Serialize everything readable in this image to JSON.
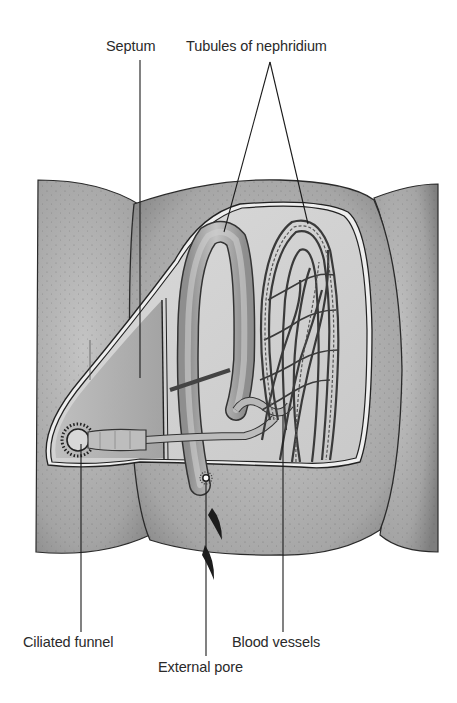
{
  "diagram": {
    "labels": {
      "septum": "Septum",
      "tubules": "Tubules of nephridium",
      "ciliated_funnel": "Ciliated funnel",
      "external_pore": "External pore",
      "blood_vessels": "Blood vessels"
    },
    "colors": {
      "body_dark": "#8c8c8c",
      "body_mid": "#a8a8a8",
      "body_light": "#c6c6c6",
      "window_bg": "#d4d4d4",
      "tubule": "#b0b0b0",
      "outline": "#2a2a2a",
      "leader_line": "#1a1a1a"
    }
  }
}
